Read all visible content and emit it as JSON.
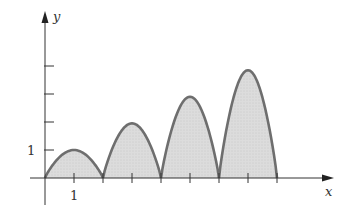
{
  "chart_data": {
    "type": "area",
    "title": "",
    "xlabel": "x",
    "ylabel": "y",
    "x_ticks": [
      1,
      2,
      3,
      4,
      5,
      6,
      7,
      8
    ],
    "x_tick_labels": [
      {
        "value": 1,
        "label": "1"
      }
    ],
    "y_ticks": [
      1,
      2,
      3,
      4
    ],
    "y_tick_labels": [
      {
        "value": 1,
        "label": "1"
      }
    ],
    "xlim": [
      -0.3,
      10
    ],
    "ylim": [
      -0.7,
      5.9
    ],
    "grid": false,
    "series": [
      {
        "name": "arches",
        "arches": [
          {
            "x_start": 0,
            "x_end": 2,
            "peak_x": 1,
            "peak_y": 1.0
          },
          {
            "x_start": 2,
            "x_end": 4,
            "peak_x": 3,
            "peak_y": 1.95
          },
          {
            "x_start": 4,
            "x_end": 6,
            "peak_x": 5,
            "peak_y": 2.9
          },
          {
            "x_start": 6,
            "x_end": 8,
            "peak_x": 7,
            "peak_y": 3.85
          }
        ],
        "fill": "#d9d9d9",
        "stroke": "#6e6e6e"
      }
    ]
  },
  "axes": {
    "x_label": "x",
    "y_label": "y",
    "tick_label_x1": "1",
    "tick_label_y1": "1"
  },
  "colors": {
    "axis": "#333333",
    "curve": "#6e6e6e",
    "fill": "#d9d9d9"
  }
}
